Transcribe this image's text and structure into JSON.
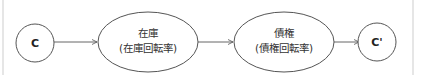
{
  "diagram": {
    "type": "flow",
    "nodes": [
      {
        "id": "c_start",
        "shape": "circle",
        "label": "C"
      },
      {
        "id": "inventory",
        "shape": "ellipse",
        "label": "在庫",
        "sublabel": "(在庫回転率)"
      },
      {
        "id": "receivables",
        "shape": "ellipse",
        "label": "債権",
        "sublabel": "(債権回転率)"
      },
      {
        "id": "c_end",
        "shape": "circle",
        "label": "C'"
      }
    ],
    "edges": [
      {
        "from": "c_start",
        "to": "inventory"
      },
      {
        "from": "inventory",
        "to": "receivables"
      },
      {
        "from": "receivables",
        "to": "c_end"
      }
    ],
    "colors": {
      "stroke": "#555555",
      "text": "#222222",
      "border": "#e6e6e6",
      "background": "#ffffff"
    }
  }
}
